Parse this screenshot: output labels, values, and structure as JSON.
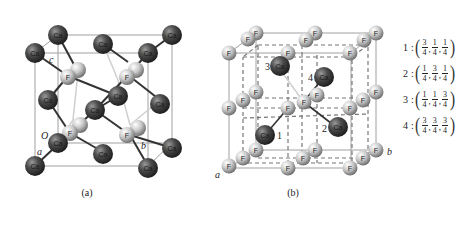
{
  "figure": {
    "panel_a": {
      "caption": "(a)",
      "axis_labels": {
        "origin": "O",
        "a": "a",
        "b": "b",
        "c": "c"
      },
      "atom_labels": {
        "ca": "Ca",
        "f": "F"
      }
    },
    "panel_b": {
      "caption": "(b)",
      "axis_labels": {
        "a": "a",
        "b": "b"
      },
      "atom_labels": {
        "ca": "Ca",
        "f": "F"
      },
      "ca_indices": [
        "1",
        "2",
        "3",
        "4"
      ]
    },
    "coordinates": [
      {
        "index": "1",
        "sep": ":",
        "x": {
          "n": "3",
          "d": "4"
        },
        "y": {
          "n": "1",
          "d": "4"
        },
        "z": {
          "n": "1",
          "d": "4"
        }
      },
      {
        "index": "2",
        "sep": ":",
        "x": {
          "n": "1",
          "d": "4"
        },
        "y": {
          "n": "3",
          "d": "4"
        },
        "z": {
          "n": "1",
          "d": "4"
        }
      },
      {
        "index": "3",
        "sep": ":",
        "x": {
          "n": "1",
          "d": "4"
        },
        "y": {
          "n": "1",
          "d": "4"
        },
        "z": {
          "n": "3",
          "d": "4"
        }
      },
      {
        "index": "4",
        "sep": ":",
        "x": {
          "n": "3",
          "d": "4"
        },
        "y": {
          "n": "3",
          "d": "4"
        },
        "z": {
          "n": "3",
          "d": "4"
        }
      }
    ],
    "colors": {
      "ca_dark": "#2e2e2e",
      "ca_light": "#8a8a8a",
      "f_dark": "#7a7a7a",
      "f_light": "#e8e8e8",
      "cell_edge": "#9a9a9a",
      "bond": "#333333",
      "bond_light": "#c8c8c8"
    }
  }
}
